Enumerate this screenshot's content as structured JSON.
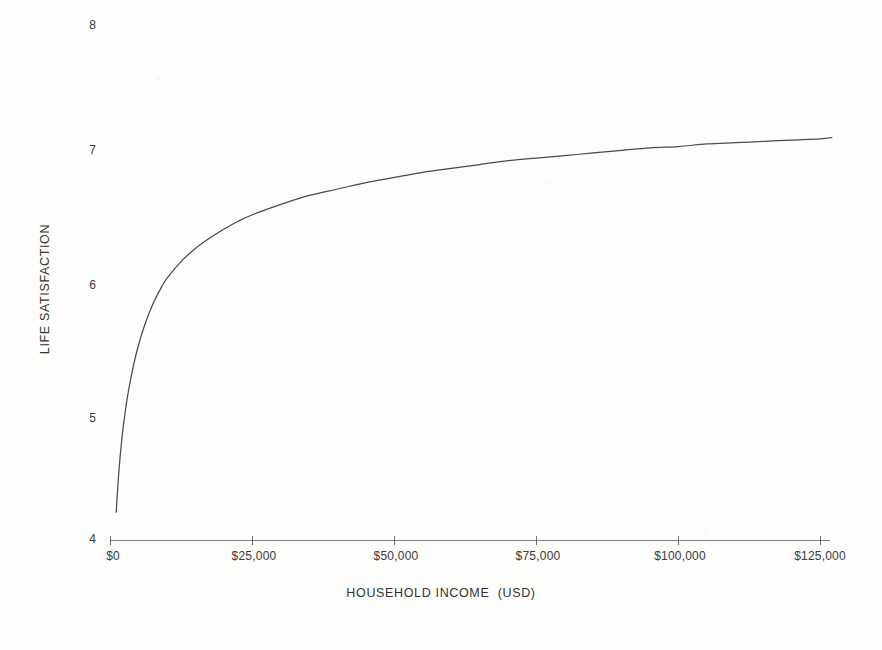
{
  "chart_data": {
    "type": "line",
    "title": "",
    "subtitle": "",
    "xlabel": "HOUSEHOLD INCOME  (USD)",
    "ylabel": "LIFE SATISFACTION",
    "xlim": [
      0,
      130000
    ],
    "ylim": [
      4,
      8
    ],
    "grid": false,
    "legend": null,
    "legend_position": "none",
    "x_tick_labels": [
      "$0",
      "$25,000",
      "$50,000",
      "$75,000",
      "$100,000",
      "$125,000"
    ],
    "x_tick_values": [
      0,
      25000,
      50000,
      75000,
      100000,
      125000
    ],
    "y_tick_labels": [
      "4",
      "5",
      "6",
      "7",
      "8"
    ],
    "y_tick_values": [
      4,
      5,
      6,
      7,
      8
    ],
    "series": [
      {
        "name": "Life satisfaction vs household income",
        "color": "#4a4a4a",
        "x": [
          1000,
          1500,
          2000,
          2500,
          3000,
          4000,
          5000,
          6000,
          7500,
          9000,
          10000,
          12500,
          15000,
          17500,
          20000,
          22500,
          25000,
          30000,
          35000,
          40000,
          45000,
          50000,
          55000,
          60000,
          65000,
          70000,
          75000,
          80000,
          85000,
          90000,
          95000,
          100000,
          105000,
          110000,
          115000,
          120000,
          125000,
          127000
        ],
        "values": [
          4.22,
          4.55,
          4.79,
          4.97,
          5.12,
          5.35,
          5.53,
          5.67,
          5.84,
          5.97,
          6.04,
          6.17,
          6.27,
          6.35,
          6.42,
          6.48,
          6.53,
          6.61,
          6.68,
          6.73,
          6.78,
          6.82,
          6.86,
          6.89,
          6.92,
          6.95,
          6.97,
          6.99,
          7.01,
          7.03,
          7.05,
          7.06,
          7.08,
          7.09,
          7.1,
          7.11,
          7.12,
          7.13
        ]
      }
    ]
  },
  "axes": {
    "x_axis_color": "#6f6f6f",
    "curve_color": "#4a4a4a",
    "background_color": "#fdfdfc"
  }
}
